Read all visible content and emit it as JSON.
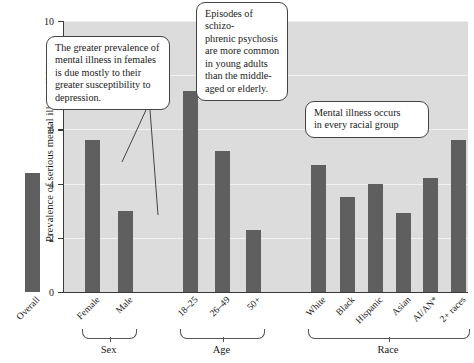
{
  "chart_data": {
    "type": "bar",
    "title": "",
    "xlabel": "",
    "ylabel": "Prevalence of serious mental illness (%)",
    "ylim": [
      0,
      10
    ],
    "yticks": [
      0,
      2,
      4,
      6,
      8,
      10
    ],
    "grid": true,
    "legend": "none",
    "bar_color": "#5f5f5f",
    "plot_background": "#dcdcdc",
    "categories": [
      "Overall",
      "Female",
      "Male",
      "18–25",
      "26–49",
      "50+",
      "White",
      "Black",
      "Hispanic",
      "Asian",
      "AI/AN*",
      "2+ races"
    ],
    "values": [
      4.4,
      5.6,
      3.0,
      7.4,
      5.2,
      2.3,
      4.7,
      3.5,
      4.0,
      2.9,
      4.2,
      5.6
    ],
    "groups": [
      {
        "label": "Sex",
        "categories": [
          "Female",
          "Male"
        ]
      },
      {
        "label": "Age",
        "categories": [
          "18–25",
          "26–49",
          "50+"
        ]
      },
      {
        "label": "Race",
        "categories": [
          "White",
          "Black",
          "Hispanic",
          "Asian",
          "AI/AN*",
          "2+ races"
        ]
      }
    ],
    "annotations": [
      {
        "id": "sex-callout",
        "text": "The greater prevalence of mental illness in females is due mostly to their greater susceptibility to depression.",
        "points_to": [
          "Female",
          "Male"
        ]
      },
      {
        "id": "age-callout",
        "text": "Episodes of schizophrenic psychosis are more common in young adults than the middle-aged or elderly.",
        "points_to": []
      },
      {
        "id": "race-callout",
        "text": "Mental illness occurs in every racial group",
        "points_to": []
      }
    ]
  },
  "axes": {
    "y_title": "Prevalence of serious mental illness (%)",
    "y_tick_labels": [
      "0",
      "2",
      "4",
      "6",
      "8",
      "10"
    ]
  },
  "callouts": {
    "sex": {
      "lines": [
        "The greater prevalence of",
        "mental illness in females",
        "is due mostly to their",
        "greater susceptibility to",
        "depression."
      ]
    },
    "age": {
      "lines": [
        "Episodes of schizo-",
        "phrenic psychosis",
        "are more common",
        "in young adults",
        "than the middle-",
        "aged or elderly."
      ]
    },
    "race": {
      "lines": [
        "Mental illness occurs",
        "in every racial group"
      ]
    }
  },
  "group_labels": {
    "sex": "Sex",
    "age": "Age",
    "race": "Race"
  }
}
